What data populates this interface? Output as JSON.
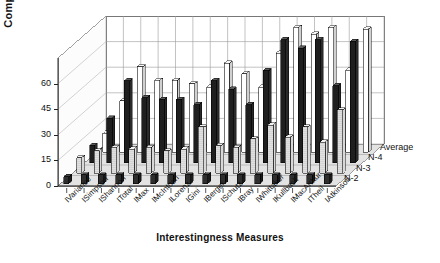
{
  "chart_data": {
    "type": "bar",
    "title": "",
    "xlabel": "Interestingness Measures",
    "ylabel": "Complexity",
    "ylim": [
      0,
      75
    ],
    "yticks": [
      0,
      15,
      30,
      45,
      60
    ],
    "grid": true,
    "projection": "3d-grouped-bar",
    "legend_position": "right-depth-axis",
    "depth_axis_labels": [
      "N-2",
      "N-3",
      "N-4",
      "Average"
    ],
    "categories": [
      "IVariance",
      "ISimpson",
      "IShannon",
      "ITotal",
      "IMax",
      "IMcIntosh",
      "ILorenz",
      "IGini",
      "IBerger",
      "ISchutz",
      "IBray",
      "IWhittaker",
      "IKullback",
      "IMacArthur",
      "ITheil",
      "IAtkinson"
    ],
    "series": [
      {
        "name": "N-2",
        "values": [
          4,
          5,
          5,
          5,
          5,
          5,
          5,
          5,
          5,
          5,
          5,
          5,
          5,
          5,
          5,
          5
        ]
      },
      {
        "name": "N-3",
        "values": [
          9,
          13,
          15,
          14,
          15,
          13,
          14,
          27,
          16,
          15,
          20,
          28,
          21,
          27,
          18,
          37
        ]
      },
      {
        "name": "N-4",
        "values": [
          10,
          26,
          48,
          38,
          37,
          37,
          34,
          48,
          43,
          34,
          54,
          72,
          67,
          72,
          45,
          71
        ]
      },
      {
        "name": "Average",
        "values": [
          11,
          30,
          50,
          42,
          42,
          40,
          38,
          52,
          46,
          38,
          58,
          73,
          69,
          73,
          48,
          72
        ]
      }
    ]
  }
}
